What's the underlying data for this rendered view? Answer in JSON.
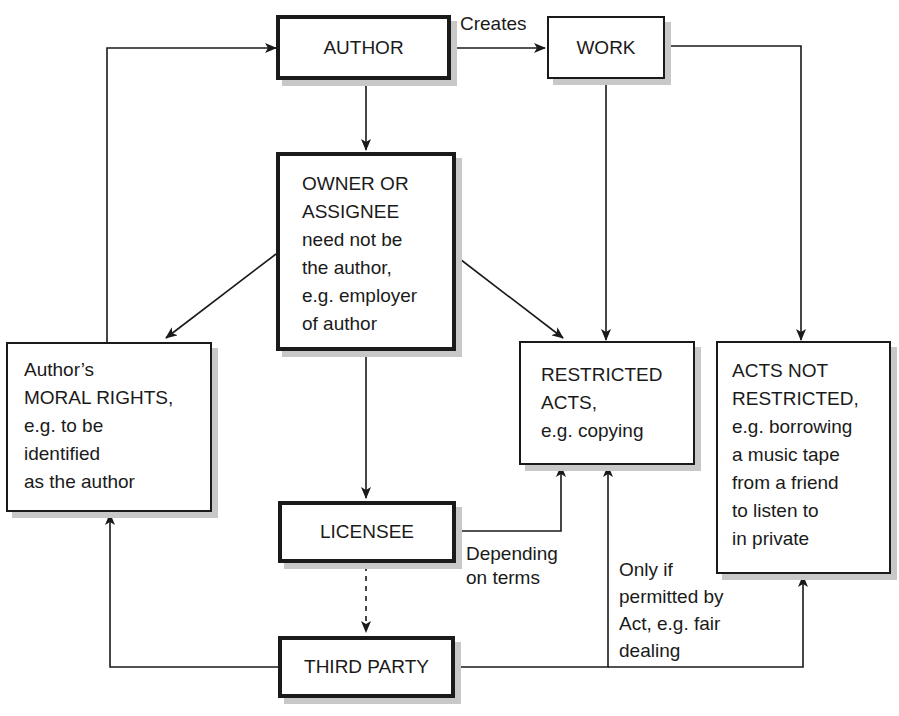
{
  "diagram": {
    "type": "flowchart",
    "nodes": {
      "author": {
        "label": "AUTHOR"
      },
      "work": {
        "label": "WORK"
      },
      "owner": {
        "label": "OWNER OR\nASSIGNEE\nneed not be\nthe author,\ne.g. employer\nof author"
      },
      "moral_rights": {
        "label": "Author’s\nMORAL RIGHTS,\ne.g. to be\nidentified\nas the author"
      },
      "restricted_acts": {
        "label": "RESTRICTED\nACTS,\ne.g. copying"
      },
      "acts_not_restricted": {
        "label": "ACTS NOT\nRESTRICTED,\ne.g. borrowing\na music tape\nfrom a friend\nto listen to\nin private"
      },
      "licensee": {
        "label": "LICENSEE"
      },
      "third_party": {
        "label": "THIRD PARTY"
      }
    },
    "edge_labels": {
      "creates": "Creates",
      "depending": "Depending\non terms",
      "only_if": "Only if\npermitted by\nAct, e.g. fair\ndealing"
    },
    "edges": [
      {
        "from": "author",
        "to": "work",
        "label": "Creates",
        "style": "solid"
      },
      {
        "from": "author",
        "to": "owner",
        "style": "solid"
      },
      {
        "from": "work",
        "to": "restricted_acts",
        "style": "solid"
      },
      {
        "from": "work",
        "to": "acts_not_restricted",
        "style": "solid"
      },
      {
        "from": "owner",
        "to": "moral_rights",
        "style": "solid"
      },
      {
        "from": "owner",
        "to": "restricted_acts",
        "style": "solid"
      },
      {
        "from": "owner",
        "to": "licensee",
        "style": "solid"
      },
      {
        "from": "moral_rights",
        "to": "author",
        "style": "solid"
      },
      {
        "from": "licensee",
        "to": "restricted_acts",
        "label": "Depending on terms",
        "style": "solid"
      },
      {
        "from": "licensee",
        "to": "third_party",
        "style": "dashed"
      },
      {
        "from": "third_party",
        "to": "moral_rights",
        "style": "solid"
      },
      {
        "from": "third_party",
        "to": "restricted_acts",
        "label": "Only if permitted by Act, e.g. fair dealing",
        "style": "solid"
      },
      {
        "from": "third_party",
        "to": "acts_not_restricted",
        "style": "solid"
      }
    ]
  }
}
